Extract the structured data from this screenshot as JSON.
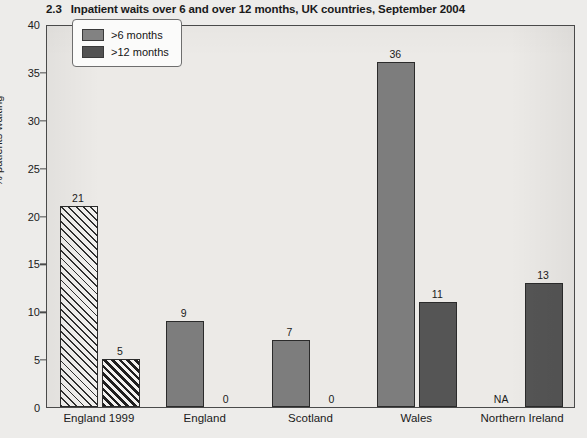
{
  "title": {
    "number": "2.3",
    "text": "Inpatient waits over 6 and over 12 months, UK countries, September 2004"
  },
  "legend": {
    "items": [
      {
        "label": ">6 months",
        "color": "#7d7d7d"
      },
      {
        "label": ">12 months",
        "color": "#555555"
      }
    ]
  },
  "chart_data": {
    "type": "bar",
    "title": "2.3  Inpatient waits over 6 and over 12 months, UK countries, September 2004",
    "xlabel": "",
    "ylabel": "% patients waiting",
    "ylim": [
      0,
      40
    ],
    "yticks": [
      0,
      5,
      10,
      15,
      20,
      25,
      30,
      35,
      40
    ],
    "ytick_labels": [
      "0",
      "5",
      "10",
      "15",
      "20",
      "25",
      "30",
      "35",
      "40"
    ],
    "grid": false,
    "legend_position": "upper left",
    "categories": [
      "England 1999",
      "England",
      "Scotland",
      "Wales",
      "Northern Ireland"
    ],
    "series": [
      {
        "name": ">6 months",
        "color": "#7d7d7d",
        "values": [
          21,
          9,
          7,
          36,
          null
        ],
        "labels": [
          "21",
          "9",
          "7",
          "36",
          "NA"
        ]
      },
      {
        "name": ">12 months",
        "color": "#555555",
        "values": [
          5,
          0,
          0,
          11,
          13
        ],
        "labels": [
          "5",
          "0",
          "0",
          "11",
          "13"
        ]
      }
    ]
  }
}
